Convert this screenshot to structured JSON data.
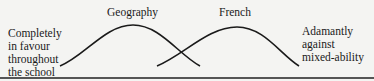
{
  "diagram": {
    "left_label": [
      "Completely",
      "in favour",
      "throughout",
      "the school"
    ],
    "right_label": [
      "Adamantly",
      "against",
      "mixed-ability"
    ],
    "curves": [
      {
        "name": "Geography",
        "start": [
          60,
          66
        ],
        "peak": [
          133,
          25
        ],
        "end": [
          200,
          66
        ]
      },
      {
        "name": "French",
        "start": [
          157,
          66
        ],
        "peak": [
          237,
          27
        ],
        "end": [
          299,
          66
        ]
      }
    ],
    "line_color": "#1a1a1a",
    "background": "#f4f4f2"
  }
}
